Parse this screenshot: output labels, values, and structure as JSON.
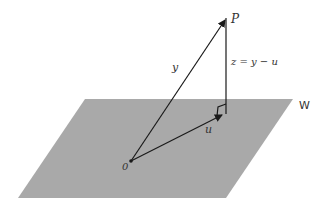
{
  "diagram": {
    "plane": {
      "label": "W",
      "color": "#a9a9a9"
    },
    "points": {
      "origin": {
        "label": "0"
      },
      "P": {
        "label": "P"
      }
    },
    "vectors": {
      "y": {
        "label": "y"
      },
      "u": {
        "label": "u"
      },
      "z": {
        "label": "z = y − u"
      }
    },
    "line_color": "#1a1a1a"
  }
}
